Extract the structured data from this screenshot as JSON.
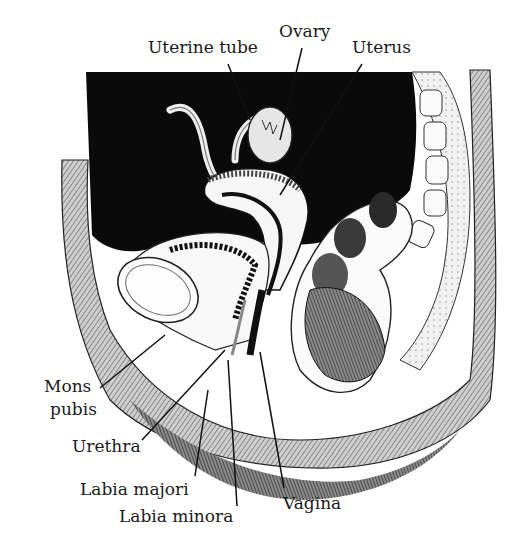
{
  "figure": {
    "colors": {
      "ink": "#111111",
      "cavity": "#0a0a0a",
      "paper": "#ffffff",
      "tissue": "#e9e9e9",
      "shade": "#5a5a5a"
    }
  },
  "labels": [
    {
      "id": "uterine-tube",
      "text": "Uterine tube",
      "x": 148,
      "y": 38,
      "line": [
        228,
        64,
        250,
        120
      ]
    },
    {
      "id": "ovary",
      "text": "Ovary",
      "x": 279,
      "y": 22,
      "line": [
        302,
        48,
        280,
        140
      ]
    },
    {
      "id": "uterus",
      "text": "Uterus",
      "x": 352,
      "y": 38,
      "line": [
        362,
        64,
        280,
        195
      ]
    },
    {
      "id": "mons-pubis-1",
      "text": "Mons",
      "x": 44,
      "y": 377
    },
    {
      "id": "mons-pubis-2",
      "text": "pubis",
      "x": 50,
      "y": 400,
      "line": [
        100,
        388,
        165,
        335
      ]
    },
    {
      "id": "urethra",
      "text": "Urethra",
      "x": 72,
      "y": 437,
      "line": [
        142,
        440,
        225,
        350
      ]
    },
    {
      "id": "labia-majori",
      "text": "Labia majori",
      "x": 80,
      "y": 480,
      "line": [
        195,
        476,
        208,
        390
      ]
    },
    {
      "id": "labia-minora",
      "text": "Labia minora",
      "x": 119,
      "y": 507,
      "line": [
        237,
        506,
        228,
        360
      ]
    },
    {
      "id": "vagina",
      "text": "Vagina",
      "x": 283,
      "y": 494,
      "line": [
        284,
        488,
        260,
        352
      ]
    }
  ]
}
